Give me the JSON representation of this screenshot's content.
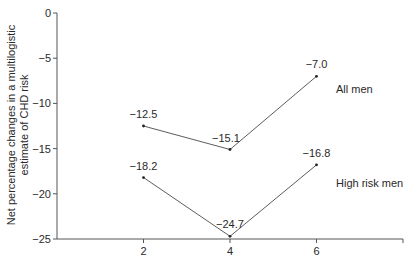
{
  "chart_data": {
    "type": "line",
    "title": "",
    "xlabel": "",
    "ylabel": "Net percentage changes in a multilogistic estimate of CHD risk",
    "ylabel_lines": [
      "Net percentage changes in a multilogistic",
      "estimate of CHD risk"
    ],
    "x": [
      2,
      4,
      6
    ],
    "x_ticks": [
      2,
      4,
      6
    ],
    "y_ticks": [
      0,
      -5,
      -10,
      -15,
      -20,
      -25
    ],
    "y_tick_labels": [
      "0",
      "−5",
      "−10",
      "−15",
      "−20",
      "−25"
    ],
    "xlim": [
      0,
      8
    ],
    "ylim": [
      -25,
      0
    ],
    "grid": false,
    "legend_position": "inline-right",
    "series": [
      {
        "name": "All men",
        "values": [
          -12.5,
          -15.1,
          -7.0
        ],
        "labels": [
          "−12.5",
          "−15.1",
          "−7.0"
        ]
      },
      {
        "name": "High risk men",
        "values": [
          -18.2,
          -24.7,
          -16.8
        ],
        "labels": [
          "−18.2",
          "−24.7",
          "−16.8"
        ]
      }
    ]
  },
  "colors": {
    "line": "#4a4a4a",
    "axis": "#555555",
    "text": "#2a2a2a"
  }
}
